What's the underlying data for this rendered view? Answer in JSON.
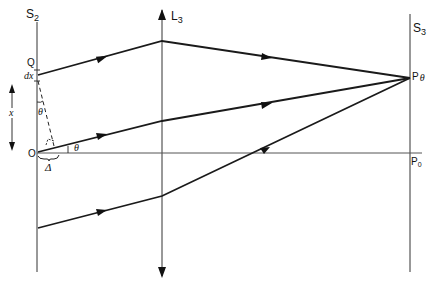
{
  "diagram": {
    "title": "",
    "screens": {
      "s2": {
        "label": "S",
        "sub": "2"
      },
      "s3": {
        "label": "S",
        "sub": "3"
      }
    },
    "lens": {
      "label": "L",
      "sub": "3"
    },
    "points": {
      "Q": "Q",
      "dx": "dx",
      "O": "O",
      "P_theta": {
        "label": "P",
        "sub": "θ"
      },
      "P_0": {
        "label": "P",
        "sub": "0"
      }
    },
    "annotations": {
      "x": "x",
      "theta_upper": "θ",
      "theta_lower": "θ",
      "delta": "Δ"
    },
    "colors": {
      "ray": "#1a1a1a",
      "axis": "#555555",
      "screen": "#333333"
    }
  }
}
